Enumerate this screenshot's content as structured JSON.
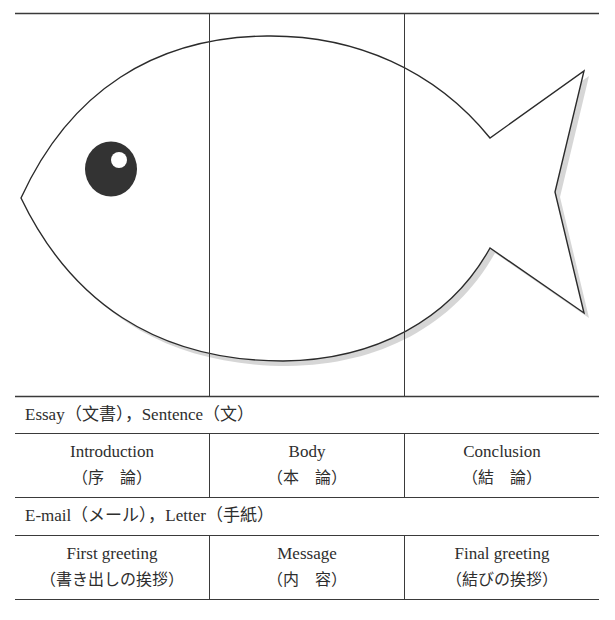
{
  "diagram": {
    "fish": {
      "outline_color": "#2b2b2b",
      "shadow_color": "#c8c8c8",
      "eye_color": "#333333",
      "eye_highlight_color": "#ffffff",
      "sections": [
        "head",
        "body",
        "tail"
      ]
    }
  },
  "sections": [
    {
      "title": "Essay（文書），Sentence（文）",
      "columns": [
        {
          "en": "Introduction",
          "jp": "（序　論）"
        },
        {
          "en": "Body",
          "jp": "（本　論）"
        },
        {
          "en": "Conclusion",
          "jp": "（結　論）"
        }
      ]
    },
    {
      "title": "E-mail（メール），Letter（手紙）",
      "columns": [
        {
          "en": "First greeting",
          "jp": "（書き出しの挨拶）"
        },
        {
          "en": "Message",
          "jp": "（内　容）"
        },
        {
          "en": "Final greeting",
          "jp": "（結びの挨拶）"
        }
      ]
    }
  ]
}
